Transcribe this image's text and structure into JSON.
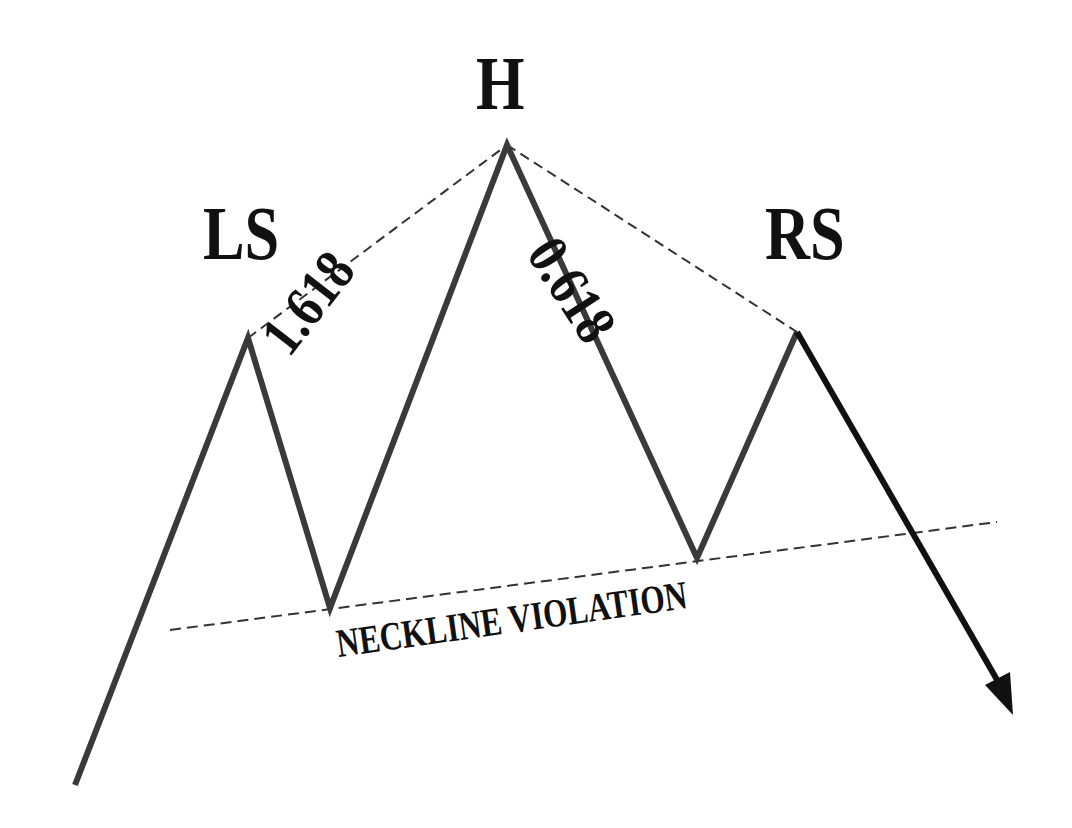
{
  "diagram": {
    "labels": {
      "head": "H",
      "left_shoulder": "LS",
      "right_shoulder": "RS",
      "left_ratio": "1.618",
      "right_ratio": "0.618",
      "neckline": "NECKLINE VIOLATION"
    },
    "colors": {
      "line": "#3a3a3a",
      "arrow": "#111111",
      "dashed": "#333333",
      "background": "#ffffff"
    },
    "points": {
      "start": [
        75,
        785
      ],
      "left_shoulder": [
        248,
        338
      ],
      "left_trough": [
        330,
        608
      ],
      "head": [
        507,
        145
      ],
      "right_trough": [
        697,
        558
      ],
      "right_shoulder": [
        797,
        332
      ],
      "arrow_end": [
        1012,
        712
      ]
    },
    "neckline_line": [
      [
        170,
        630
      ],
      [
        997,
        522
      ]
    ]
  }
}
